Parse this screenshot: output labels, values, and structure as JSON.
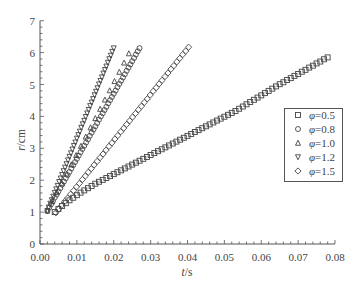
{
  "axes": {
    "x_label_var": "t",
    "x_label_unit": "/s",
    "y_label_var": "r",
    "y_label_unit": "/cm"
  },
  "legend": {
    "items": [
      {
        "marker": "square",
        "var": "φ",
        "value": "=0.5"
      },
      {
        "marker": "circle",
        "var": "φ",
        "value": "=0.8"
      },
      {
        "marker": "triangle-up",
        "var": "φ",
        "value": "=1.0"
      },
      {
        "marker": "triangle-down",
        "var": "φ",
        "value": "=1.2"
      },
      {
        "marker": "diamond",
        "var": "φ",
        "value": "=1.5"
      }
    ]
  },
  "style": {
    "marker_color": "#444444",
    "axis_color": "#555555",
    "legend_border": "#555555"
  },
  "chart_data": {
    "type": "scatter",
    "title": "",
    "xlabel": "t/s",
    "ylabel": "r/cm",
    "xlim": [
      0,
      0.08
    ],
    "ylim": [
      0,
      7
    ],
    "x_major_step": 0.01,
    "x_minor_step": 0.002,
    "y_major_step": 1,
    "y_minor_step": 0.2,
    "xticks": [
      "0.00",
      "0.01",
      "0.02",
      "0.03",
      "0.04",
      "0.05",
      "0.06",
      "0.07",
      "0.08"
    ],
    "yticks": [
      "0",
      "1",
      "2",
      "3",
      "4",
      "5",
      "6",
      "7"
    ],
    "grid": false,
    "legend_position": "inside right, middle",
    "series": [
      {
        "name": "φ=0.5",
        "marker": "square",
        "x": [
          0.004,
          0.005,
          0.006,
          0.007,
          0.008,
          0.009,
          0.01,
          0.011,
          0.012,
          0.013,
          0.014,
          0.015,
          0.016,
          0.017,
          0.018,
          0.019,
          0.02,
          0.021,
          0.022,
          0.023,
          0.024,
          0.025,
          0.026,
          0.027,
          0.028,
          0.029,
          0.03,
          0.031,
          0.032,
          0.033,
          0.034,
          0.035,
          0.036,
          0.037,
          0.038,
          0.039,
          0.04,
          0.041,
          0.042,
          0.043,
          0.044,
          0.045,
          0.046,
          0.047,
          0.048,
          0.049,
          0.05,
          0.051,
          0.052,
          0.053,
          0.054,
          0.055,
          0.056,
          0.057,
          0.058,
          0.059,
          0.06,
          0.061,
          0.062,
          0.063,
          0.064,
          0.065,
          0.066,
          0.067,
          0.068,
          0.069,
          0.07,
          0.071,
          0.072,
          0.073,
          0.074,
          0.075,
          0.076,
          0.077,
          0.078
        ],
        "y": [
          1.0,
          1.1,
          1.19,
          1.28,
          1.37,
          1.45,
          1.53,
          1.61,
          1.68,
          1.75,
          1.82,
          1.89,
          1.95,
          2.01,
          2.07,
          2.13,
          2.19,
          2.25,
          2.31,
          2.37,
          2.43,
          2.49,
          2.55,
          2.61,
          2.67,
          2.73,
          2.79,
          2.85,
          2.91,
          2.97,
          3.03,
          3.09,
          3.15,
          3.21,
          3.27,
          3.33,
          3.39,
          3.45,
          3.51,
          3.57,
          3.63,
          3.69,
          3.75,
          3.81,
          3.87,
          3.93,
          3.99,
          4.05,
          4.11,
          4.17,
          4.24,
          4.31,
          4.38,
          4.45,
          4.52,
          4.59,
          4.66,
          4.73,
          4.8,
          4.87,
          4.94,
          5.01,
          5.07,
          5.14,
          5.2,
          5.27,
          5.33,
          5.4,
          5.46,
          5.53,
          5.59,
          5.66,
          5.72,
          5.79,
          5.85
        ]
      },
      {
        "name": "φ=0.8",
        "marker": "circle",
        "x": [
          0.002,
          0.0025,
          0.003,
          0.0035,
          0.004,
          0.0045,
          0.005,
          0.0055,
          0.006,
          0.0065,
          0.007,
          0.0075,
          0.008,
          0.0085,
          0.009,
          0.0095,
          0.01,
          0.0105,
          0.011,
          0.0115,
          0.012,
          0.0125,
          0.013,
          0.0135,
          0.014,
          0.0145,
          0.015,
          0.0155,
          0.016,
          0.0165,
          0.017,
          0.0175,
          0.018,
          0.0185,
          0.019,
          0.0195,
          0.02,
          0.0205,
          0.021,
          0.0215,
          0.022,
          0.0225,
          0.023,
          0.0235,
          0.024,
          0.0245,
          0.025,
          0.0255,
          0.026,
          0.0265,
          0.027
        ],
        "y": [
          1.04,
          1.14,
          1.24,
          1.35,
          1.45,
          1.55,
          1.65,
          1.75,
          1.86,
          1.96,
          2.06,
          2.16,
          2.26,
          2.37,
          2.47,
          2.57,
          2.67,
          2.77,
          2.88,
          2.98,
          3.08,
          3.18,
          3.28,
          3.39,
          3.49,
          3.59,
          3.69,
          3.79,
          3.9,
          4.0,
          4.1,
          4.2,
          4.3,
          4.41,
          4.51,
          4.61,
          4.71,
          4.81,
          4.92,
          5.02,
          5.12,
          5.22,
          5.32,
          5.43,
          5.53,
          5.63,
          5.73,
          5.83,
          5.94,
          6.04,
          6.14
        ]
      },
      {
        "name": "φ=1.0",
        "marker": "triangle-up",
        "x": [
          0.002,
          0.0033,
          0.0046,
          0.0059,
          0.0072,
          0.0085,
          0.0098,
          0.0111,
          0.0124,
          0.0137,
          0.015,
          0.0163,
          0.0176,
          0.0189,
          0.0202,
          0.0215,
          0.0228,
          0.0241
        ],
        "y": [
          1.04,
          1.33,
          1.62,
          1.91,
          2.2,
          2.49,
          2.78,
          3.07,
          3.36,
          3.65,
          3.94,
          4.23,
          4.52,
          4.81,
          5.1,
          5.39,
          5.68,
          5.97
        ]
      },
      {
        "name": "φ=1.2",
        "marker": "triangle-down",
        "x": [
          0.002,
          0.0024,
          0.0028,
          0.0032,
          0.0036,
          0.004,
          0.0044,
          0.0048,
          0.0052,
          0.0056,
          0.006,
          0.0064,
          0.0068,
          0.0072,
          0.0076,
          0.008,
          0.0084,
          0.0088,
          0.0092,
          0.0096,
          0.01,
          0.0104,
          0.0108,
          0.0112,
          0.0116,
          0.012,
          0.0124,
          0.0128,
          0.0132,
          0.0136,
          0.014,
          0.0144,
          0.0148,
          0.0152,
          0.0156,
          0.016,
          0.0164,
          0.0168,
          0.0172,
          0.0176,
          0.018,
          0.0184,
          0.0188,
          0.0192,
          0.0196,
          0.02
        ],
        "y": [
          1.04,
          1.15,
          1.27,
          1.38,
          1.49,
          1.61,
          1.72,
          1.83,
          1.95,
          2.06,
          2.17,
          2.29,
          2.4,
          2.51,
          2.63,
          2.74,
          2.85,
          2.97,
          3.08,
          3.19,
          3.31,
          3.42,
          3.53,
          3.65,
          3.76,
          3.87,
          3.99,
          4.1,
          4.21,
          4.33,
          4.44,
          4.55,
          4.67,
          4.78,
          4.89,
          5.01,
          5.12,
          5.23,
          5.35,
          5.46,
          5.57,
          5.69,
          5.8,
          5.91,
          6.03,
          6.14
        ]
      },
      {
        "name": "φ=1.5",
        "marker": "diamond",
        "x": [
          0.0043,
          0.0051,
          0.0059,
          0.0067,
          0.0075,
          0.0083,
          0.0091,
          0.0099,
          0.0107,
          0.0115,
          0.0123,
          0.0131,
          0.0139,
          0.0147,
          0.0155,
          0.0163,
          0.0171,
          0.0179,
          0.0187,
          0.0195,
          0.0203,
          0.0211,
          0.0219,
          0.0227,
          0.0235,
          0.0243,
          0.0251,
          0.0259,
          0.0267,
          0.0275,
          0.0283,
          0.0291,
          0.0299,
          0.0307,
          0.0315,
          0.0323,
          0.0331,
          0.0339,
          0.0347,
          0.0355,
          0.0363,
          0.0371,
          0.0379,
          0.0387,
          0.0395,
          0.0403
        ],
        "y": [
          0.98,
          1.1,
          1.21,
          1.33,
          1.44,
          1.56,
          1.67,
          1.79,
          1.9,
          2.02,
          2.13,
          2.25,
          2.36,
          2.48,
          2.59,
          2.71,
          2.82,
          2.94,
          3.06,
          3.17,
          3.29,
          3.4,
          3.52,
          3.63,
          3.75,
          3.86,
          3.98,
          4.09,
          4.21,
          4.32,
          4.44,
          4.55,
          4.67,
          4.79,
          4.9,
          5.02,
          5.13,
          5.25,
          5.36,
          5.48,
          5.59,
          5.71,
          5.82,
          5.94,
          6.05,
          6.17
        ]
      }
    ]
  }
}
